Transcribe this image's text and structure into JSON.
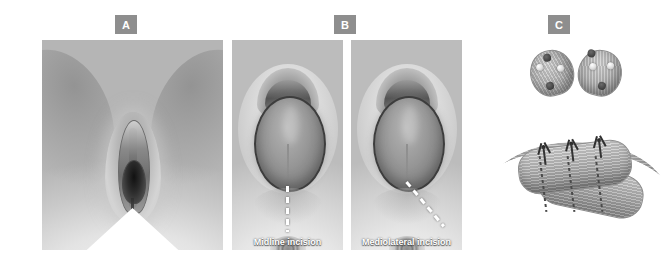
{
  "figure": {
    "background_color": "#ffffff",
    "width": 672,
    "height": 266
  },
  "panels": [
    {
      "id": "A",
      "chip_label": "A",
      "caption": "",
      "description": "Normal perineal anatomy, frontal view",
      "annotations": []
    },
    {
      "id": "B",
      "chip_label": "B",
      "caption": "",
      "description": "Crowning at the introitus with incision sites marked",
      "annotations": [
        {
          "label": "Midline incision",
          "line_style": "dashed",
          "line_color": "#ffffff",
          "direction": "vertical"
        },
        {
          "label": "Mediolateral incision",
          "line_style": "dashed",
          "line_color": "#ffffff",
          "direction": "diagonal"
        }
      ]
    },
    {
      "id": "C",
      "chip_label": "C",
      "caption": "",
      "description": "Divided anal sphincter ring above and overlapping sutured repair below",
      "annotations": []
    }
  ],
  "chip": {
    "background_color": "#8e8e8e",
    "text_color": "#ffffff"
  },
  "sutures": {
    "count": 3,
    "color": "#2b2b2b"
  },
  "palette": {
    "tissue_light": "#d4d4d4",
    "tissue_mid": "#9d9d9d",
    "tissue_dark": "#676767",
    "outline": "#3d3d3d",
    "annotation": "#ffffff"
  }
}
